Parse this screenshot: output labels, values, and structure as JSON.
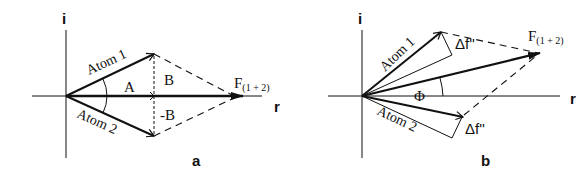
{
  "figure": {
    "panels": [
      {
        "id": "a",
        "panel_label": "a",
        "axis_imag_label": "i",
        "axis_real_label": "r",
        "vector_1_label": "Atom 1",
        "vector_2_label": "Atom 2",
        "resultant_label": "F",
        "resultant_subscript": "(1 + 2)",
        "component_A_label": "A",
        "component_B_label": "B",
        "component_negB_label": "-B"
      },
      {
        "id": "b",
        "panel_label": "b",
        "axis_imag_label": "i",
        "axis_real_label": "r",
        "vector_1_label": "Atom 1",
        "vector_2_label": "Atom 2",
        "resultant_label": "F",
        "resultant_subscript": "(1 + 2)",
        "anomalous_1_label": "Δf''",
        "anomalous_2_label": "Δf''",
        "phase_label": "Φ"
      }
    ],
    "colors": {
      "ink": "#111111",
      "background": "#ffffff"
    }
  }
}
